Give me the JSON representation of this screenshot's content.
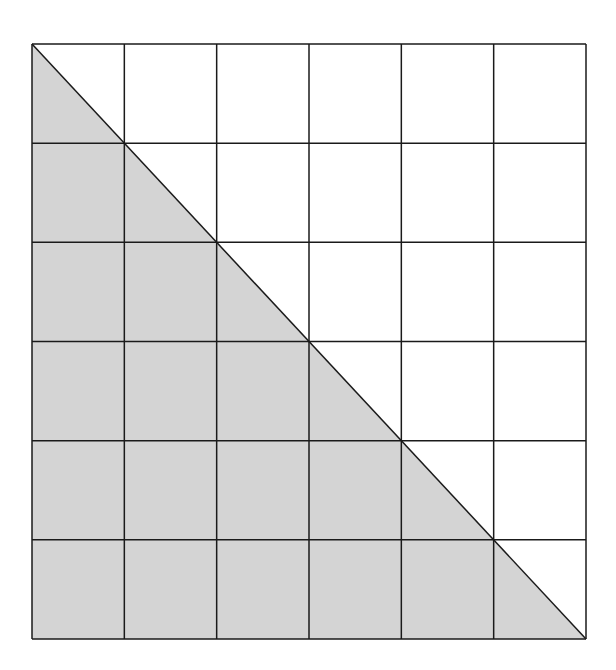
{
  "diagram": {
    "type": "grid-with-shaded-triangle",
    "grid": {
      "rows": 6,
      "columns": 6,
      "left": 32,
      "top": 44,
      "right": 586,
      "bottom": 639,
      "line_color": "#1a1a1a",
      "line_width": 1.5,
      "background": "#ffffff"
    },
    "shaded_region": {
      "shape": "right-triangle",
      "vertices": [
        "top-left",
        "bottom-left",
        "bottom-right"
      ],
      "fill_color": "#d4d4d4"
    },
    "diagonal": {
      "from": "top-left",
      "to": "bottom-right",
      "color": "#1a1a1a"
    }
  }
}
